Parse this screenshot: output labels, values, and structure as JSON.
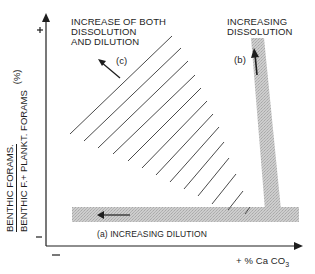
{
  "diagram": {
    "y_axis": {
      "numerator": "BENTHIC FORAMS.",
      "denominator": "BENTHIC F.+ PLANKT. FORAMS",
      "unit": "(%)",
      "plus_label": "+",
      "minus_label": "–"
    },
    "x_axis": {
      "label_prefix": "+  % Ca CO",
      "label_sub": "3",
      "minus_label": "–"
    },
    "regions": {
      "a": {
        "label": "(a) INCREASING DILUTION"
      },
      "b": {
        "letter": "(b)",
        "title_line1": "INCREASING",
        "title_line2": "DISSOLUTION"
      },
      "c": {
        "letter": "(c)",
        "title_line1": "INCREASE OF BOTH",
        "title_line2": "DISSOLUTION",
        "title_line3": "AND DILUTION"
      }
    },
    "colors": {
      "band_gray": "#c4c4c4",
      "ink": "#1e1e1e",
      "hatch": "#555555"
    }
  }
}
